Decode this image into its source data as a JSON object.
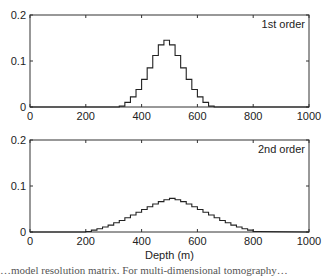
{
  "chart_data": [
    {
      "type": "line",
      "style": "step",
      "title": "",
      "annotation": "1st order",
      "xlabel": "",
      "ylabel": "",
      "xlim": [
        0,
        1000
      ],
      "ylim": [
        0,
        0.2
      ],
      "xticks": [
        "0",
        "200",
        "400",
        "600",
        "800",
        "1000"
      ],
      "yticks": [
        "0",
        "0.1",
        "0.2"
      ],
      "grid": false,
      "x": [
        320,
        340,
        360,
        380,
        400,
        420,
        440,
        460,
        480,
        500,
        520,
        540,
        560,
        580,
        600,
        620,
        640,
        660
      ],
      "values": [
        0.002,
        0.01,
        0.022,
        0.038,
        0.06,
        0.085,
        0.112,
        0.135,
        0.145,
        0.135,
        0.112,
        0.085,
        0.06,
        0.038,
        0.022,
        0.01,
        0.002,
        0
      ]
    },
    {
      "type": "line",
      "style": "step",
      "title": "",
      "annotation": "2nd order",
      "xlabel": "Depth (m)",
      "ylabel": "",
      "xlim": [
        0,
        1000
      ],
      "ylim": [
        0,
        0.2
      ],
      "xticks": [
        "0",
        "200",
        "400",
        "600",
        "800",
        "1000"
      ],
      "yticks": [
        "0",
        "0.1",
        "0.2"
      ],
      "grid": false,
      "x": [
        200,
        220,
        240,
        260,
        280,
        300,
        320,
        340,
        360,
        380,
        400,
        420,
        440,
        460,
        480,
        500,
        520,
        540,
        560,
        580,
        600,
        620,
        640,
        660,
        680,
        700,
        720,
        740,
        760,
        780,
        800
      ],
      "values": [
        0.001,
        0.004,
        0.007,
        0.011,
        0.015,
        0.02,
        0.025,
        0.031,
        0.037,
        0.043,
        0.049,
        0.055,
        0.061,
        0.066,
        0.07,
        0.073,
        0.07,
        0.066,
        0.061,
        0.055,
        0.049,
        0.043,
        0.037,
        0.031,
        0.025,
        0.02,
        0.015,
        0.011,
        0.007,
        0.004,
        0.001
      ]
    }
  ],
  "caption_fragment": "…model resolution matrix. For multi-dimensional tomography…"
}
